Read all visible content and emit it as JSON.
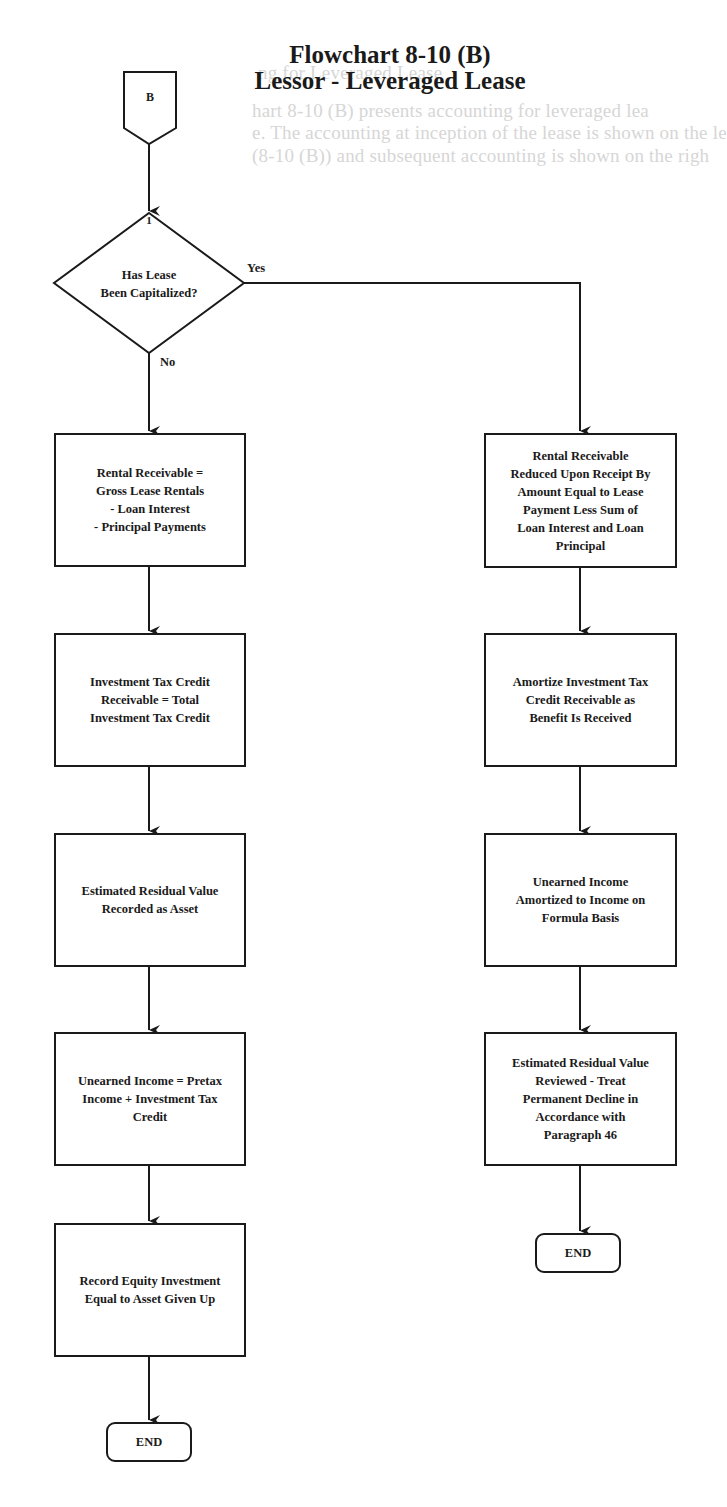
{
  "page": {
    "bleed_through_lines": [
      "ng for Leveraged Lease",
      "hart 8-10 (B) presents accounting for leveraged lea",
      "e. The accounting at inception of the lease is shown on the le",
      "(8-10 (B)) and subsequent accounting is shown on the righ"
    ]
  },
  "title": {
    "line1": "Flowchart 8-10 (B)",
    "line2": "Lessor - Leveraged Lease"
  },
  "connector": {
    "label": "B"
  },
  "decision": {
    "number": "1",
    "question": "Has Lease\nBeen Capitalized?",
    "yes_label": "Yes",
    "no_label": "No"
  },
  "left_branch": {
    "steps": [
      {
        "text": "Rental Receivable =\nGross Lease Rentals\n- Loan Interest\n- Principal Payments"
      },
      {
        "text": "Investment Tax Credit\nReceivable = Total\nInvestment Tax Credit"
      },
      {
        "text": "Estimated Residual Value\nRecorded as Asset"
      },
      {
        "text": "Unearned Income = Pretax\nIncome + Investment Tax\nCredit"
      },
      {
        "text": "Record Equity Investment\nEqual to Asset Given Up"
      }
    ],
    "end_label": "END"
  },
  "right_branch": {
    "steps": [
      {
        "text": "Rental Receivable\nReduced Upon Receipt By\nAmount Equal to Lease\nPayment Less Sum of\nLoan Interest and Loan\nPrincipal"
      },
      {
        "text": "Amortize Investment Tax\nCredit Receivable as\nBenefit Is Received"
      },
      {
        "text": "Unearned Income\nAmortized to Income on\nFormula Basis"
      },
      {
        "text": "Estimated Residual Value\nReviewed - Treat\nPermanent Decline in\nAccordance with\nParagraph 46"
      }
    ],
    "end_label": "END"
  },
  "colors": {
    "ink": "#1a1a1a",
    "background": "#ffffff",
    "bleed_through": "#d6d6d6"
  }
}
